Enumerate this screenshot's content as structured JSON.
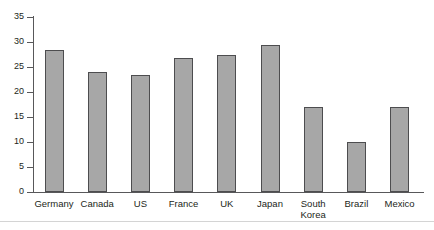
{
  "chart_data": {
    "type": "bar",
    "title": "",
    "subtitle": "",
    "xlabel": "",
    "ylabel": "",
    "ylim": [
      0,
      35
    ],
    "grid": false,
    "legend": false,
    "legend_position": "none",
    "bar_fill_color": "#a7a7a7",
    "bar_border_color": "#4d4d4f",
    "axis_color": "#58585a",
    "text_color": "#231f20",
    "background_color": "#ffffff",
    "y_ticks": [
      0,
      5,
      10,
      15,
      20,
      25,
      30,
      35
    ],
    "y_tick_labels": [
      "0",
      "5",
      "10",
      "15",
      "20",
      "25",
      "30",
      "35"
    ],
    "categories": [
      "Germany",
      "Canada",
      "US",
      "France",
      "UK",
      "Japan",
      "South\nKorea",
      "Brazil",
      "Mexico"
    ],
    "values": [
      28.4,
      24.1,
      23.5,
      26.9,
      27.4,
      29.5,
      17.0,
      10.0,
      17.0
    ]
  }
}
